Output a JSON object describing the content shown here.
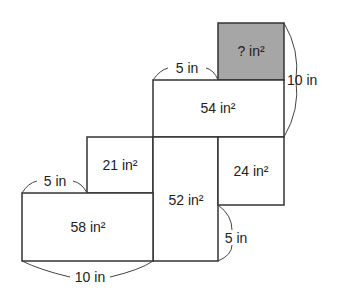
{
  "diagram": {
    "type": "net of rectangular prism",
    "faces": [
      {
        "id": "unknown",
        "label": "? in²",
        "shaded": true
      },
      {
        "id": "top-wide",
        "label": "54 in²"
      },
      {
        "id": "left-small",
        "label": "21 in²"
      },
      {
        "id": "center-tall",
        "label": "52 in²"
      },
      {
        "id": "right-small",
        "label": "24 in²"
      },
      {
        "id": "bottom-left",
        "label": "58 in²"
      }
    ],
    "dimensions": {
      "top_width": "5 in",
      "right_height": "10 in",
      "left_width": "5 in",
      "right_lower": "5 in",
      "bottom_width": "10 in"
    }
  }
}
